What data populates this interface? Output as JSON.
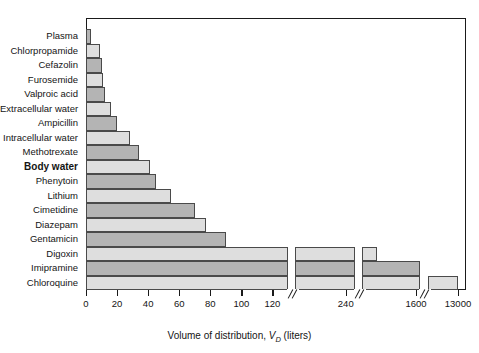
{
  "chart_data": {
    "type": "bar",
    "orientation": "horizontal",
    "title": "",
    "xlabel": "Volume of distribution, V_D (liters)",
    "ylabel": "",
    "grid": false,
    "legend": null,
    "axis_breaks": [
      130,
      260,
      1700
    ],
    "xticks": [
      0,
      20,
      40,
      60,
      80,
      100,
      120,
      240,
      1600,
      13000
    ],
    "xticklabels": [
      "0",
      "20",
      "40",
      "60",
      "80",
      "100",
      "120",
      "240",
      "1600",
      "13000"
    ],
    "categories": [
      "Plasma",
      "Chlorpropamide",
      "Cefazolin",
      "Furosemide",
      "Valproic acid",
      "Extracellular water",
      "Ampicillin",
      "Intracellular water",
      "Methotrexate",
      "Body water",
      "Phenytoin",
      "Lithium",
      "Cimetidine",
      "Diazepam",
      "Gentamicin",
      "Digoxin",
      "Imipramine",
      "Chloroquine"
    ],
    "values": [
      3,
      9,
      10,
      11,
      12,
      16,
      20,
      28,
      34,
      41,
      45,
      55,
      70,
      77,
      90,
      640,
      1700,
      13000
    ],
    "bold_categories": [
      "Body water"
    ]
  },
  "axis": {
    "xtitle_prefix": "Volume of distribution, ",
    "xtitle_var": "V",
    "xtitle_sub": "D",
    "xtitle_unit": " (liters)"
  },
  "colors": {
    "bar_dark": "#b4b4b4",
    "bar_light": "#dedede",
    "bar_border": "#4a4a4a",
    "frame": "#1a1a1a",
    "text": "#141414",
    "background": "#ffffff"
  }
}
